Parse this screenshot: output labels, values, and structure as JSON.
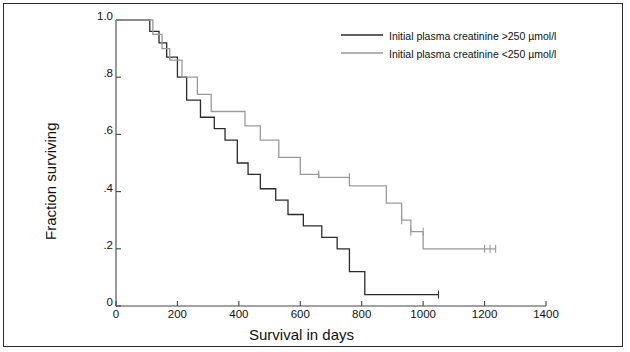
{
  "chart_data": {
    "type": "line",
    "title": "",
    "xlabel": "Survival in days",
    "ylabel": "Fraction surviving",
    "xlim": [
      0,
      1400
    ],
    "ylim": [
      0,
      1.0
    ],
    "xticks": [
      0,
      200,
      400,
      600,
      800,
      1000,
      1200,
      1400
    ],
    "xticklabels": [
      "0",
      "200",
      "400",
      "600",
      "800",
      "1000",
      "1200",
      "1400"
    ],
    "yticks": [
      0,
      0.2,
      0.4,
      0.6,
      0.8,
      1.0
    ],
    "yticklabels": [
      "0",
      ".2",
      ".4",
      ".6",
      ".8",
      "1.0"
    ],
    "grid": false,
    "legend_position": "top-right",
    "series": [
      {
        "name": "Initial plasma creatinine >250 µmol/l",
        "color": "#2b2b2b",
        "style": "step",
        "points": [
          [
            0,
            1.0
          ],
          [
            110,
            1.0
          ],
          [
            110,
            0.96
          ],
          [
            140,
            0.96
          ],
          [
            140,
            0.92
          ],
          [
            165,
            0.92
          ],
          [
            165,
            0.87
          ],
          [
            200,
            0.87
          ],
          [
            200,
            0.8
          ],
          [
            230,
            0.8
          ],
          [
            230,
            0.72
          ],
          [
            275,
            0.72
          ],
          [
            275,
            0.66
          ],
          [
            320,
            0.66
          ],
          [
            320,
            0.62
          ],
          [
            355,
            0.62
          ],
          [
            355,
            0.58
          ],
          [
            395,
            0.58
          ],
          [
            395,
            0.5
          ],
          [
            430,
            0.5
          ],
          [
            430,
            0.46
          ],
          [
            470,
            0.46
          ],
          [
            470,
            0.41
          ],
          [
            520,
            0.41
          ],
          [
            520,
            0.37
          ],
          [
            560,
            0.37
          ],
          [
            560,
            0.32
          ],
          [
            610,
            0.32
          ],
          [
            610,
            0.28
          ],
          [
            670,
            0.28
          ],
          [
            670,
            0.24
          ],
          [
            720,
            0.24
          ],
          [
            720,
            0.2
          ],
          [
            760,
            0.2
          ],
          [
            760,
            0.12
          ],
          [
            810,
            0.12
          ],
          [
            810,
            0.04
          ],
          [
            1050,
            0.04
          ]
        ],
        "censored": [
          [
            1050,
            0.04
          ]
        ]
      },
      {
        "name": "Initial plasma creatinine <250 µmol/l",
        "color": "#9a9a9a",
        "style": "step",
        "points": [
          [
            0,
            1.0
          ],
          [
            120,
            1.0
          ],
          [
            120,
            0.95
          ],
          [
            150,
            0.95
          ],
          [
            150,
            0.9
          ],
          [
            175,
            0.9
          ],
          [
            175,
            0.86
          ],
          [
            215,
            0.86
          ],
          [
            215,
            0.8
          ],
          [
            265,
            0.8
          ],
          [
            265,
            0.74
          ],
          [
            310,
            0.74
          ],
          [
            310,
            0.68
          ],
          [
            420,
            0.68
          ],
          [
            420,
            0.63
          ],
          [
            470,
            0.63
          ],
          [
            470,
            0.58
          ],
          [
            530,
            0.58
          ],
          [
            530,
            0.52
          ],
          [
            600,
            0.52
          ],
          [
            600,
            0.46
          ],
          [
            660,
            0.46
          ],
          [
            660,
            0.45
          ],
          [
            760,
            0.45
          ],
          [
            760,
            0.42
          ],
          [
            880,
            0.42
          ],
          [
            880,
            0.36
          ],
          [
            930,
            0.36
          ],
          [
            930,
            0.3
          ],
          [
            960,
            0.3
          ],
          [
            960,
            0.26
          ],
          [
            1000,
            0.26
          ],
          [
            1000,
            0.2
          ],
          [
            1235,
            0.2
          ]
        ],
        "censored": [
          [
            660,
            0.46
          ],
          [
            760,
            0.45
          ],
          [
            930,
            0.3
          ],
          [
            960,
            0.26
          ],
          [
            1000,
            0.26
          ],
          [
            1200,
            0.2
          ],
          [
            1218,
            0.2
          ],
          [
            1236,
            0.2
          ]
        ]
      }
    ]
  },
  "legend": {
    "entries": [
      {
        "label": "Initial plasma creatinine >250 µmol/l",
        "color": "#2b2b2b"
      },
      {
        "label": "Initial plasma creatinine <250 µmol/l",
        "color": "#9a9a9a"
      }
    ]
  },
  "colors": {
    "border": "#2b2b2b",
    "axis": "#444444",
    "background": "#ffffff",
    "series_high": "#2b2b2b",
    "series_low": "#9a9a9a"
  }
}
